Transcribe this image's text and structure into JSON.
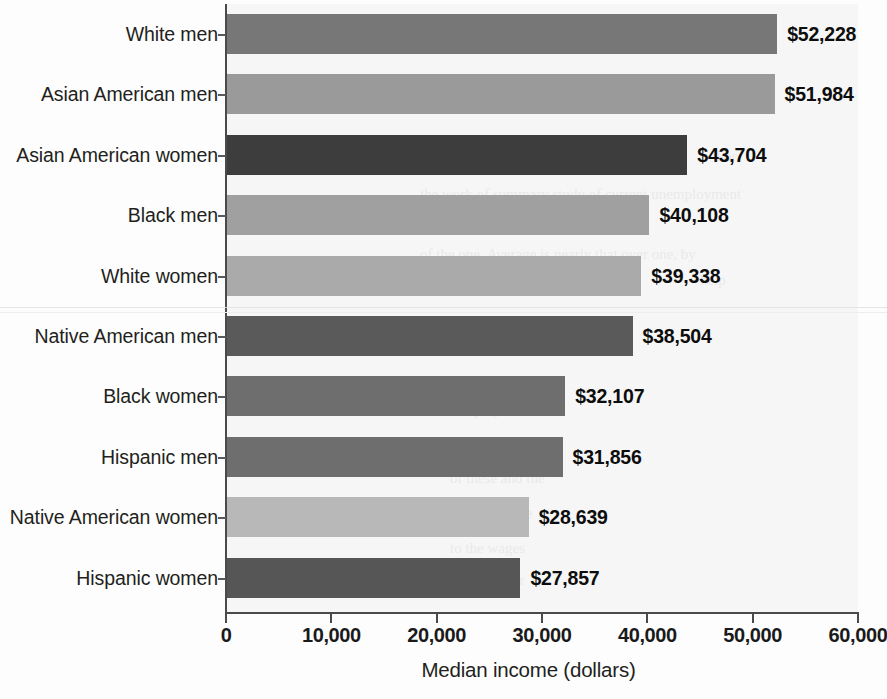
{
  "chart_data": {
    "type": "bar",
    "orientation": "horizontal",
    "title": "",
    "xlabel": "Median income (dollars)",
    "ylabel": "",
    "xlim": [
      0,
      60000
    ],
    "xticks": [
      "0",
      "10,000",
      "20,000",
      "30,000",
      "40,000",
      "50,000",
      "60,000"
    ],
    "xtick_values": [
      0,
      10000,
      20000,
      30000,
      40000,
      50000,
      60000
    ],
    "grid": false,
    "legend": false,
    "categories": [
      "White men",
      "Asian American men",
      "Asian American women",
      "Black men",
      "White women",
      "Native American men",
      "Black women",
      "Hispanic men",
      "Native American women",
      "Hispanic women"
    ],
    "values": [
      52228,
      51984,
      43704,
      40108,
      39338,
      38504,
      32107,
      31856,
      28639,
      27857
    ],
    "value_labels": [
      "$52,228",
      "$51,984",
      "$43,704",
      "$40,108",
      "$39,338",
      "$38,504",
      "$32,107",
      "$31,856",
      "$28,639",
      "$27,857"
    ],
    "bar_colors": [
      "#777777",
      "#9a9a9a",
      "#3d3d3d",
      "#a0a0a0",
      "#aaaaaa",
      "#5a5a5a",
      "#6e6e6e",
      "#6e6e6e",
      "#b8b8b8",
      "#565656"
    ],
    "plot_background": "#f6f6f6",
    "axis_color": "#4a4a4a"
  },
  "ghost_text": [
    "the same time as we say that we are",
    "to be as mere as the average not as the",
    "and then in the end of the period",
    "For",
    "the work of summary study of current unemployment",
    "budget of the one that has that that the",
    "of the one. Average is nearly that over one, by",
    "help",
    "So. Employees of the",
    "a question of the",
    "of these and the",
    "percent of the",
    "to the wages",
    "of the 30 for"
  ]
}
